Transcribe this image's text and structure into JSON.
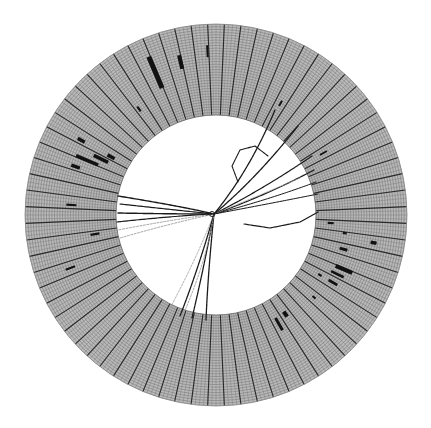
{
  "figure": {
    "type": "particle-detector-event-display",
    "title": ""
  },
  "geometry": {
    "center": [
      216,
      215
    ],
    "inner_radius": 100,
    "outer_radius": 191,
    "tower_segments": 72,
    "layer_rings": 34,
    "colors": {
      "background": "#ffffff",
      "ring_fill": "#b9b9b9",
      "fine_line": "#7a7a7a",
      "segment_line": "#2a2a2a",
      "hit": "#111111",
      "track": "#1a1a1a",
      "track_faint": "#9a9a9a"
    }
  },
  "hits": [
    {
      "angle": 200,
      "r0": 150,
      "r1": 160,
      "w": 2.2
    },
    {
      "angle": 189,
      "r0": 118,
      "r1": 127,
      "w": 2.2
    },
    {
      "angle": 176,
      "r0": 140,
      "r1": 150,
      "w": 2.2
    },
    {
      "angle": 161,
      "r0": 144,
      "r1": 153,
      "w": 3.5
    },
    {
      "angle": 157,
      "r0": 128,
      "r1": 152,
      "w": 3.5
    },
    {
      "angle": 154,
      "r0": 120,
      "r1": 136,
      "w": 3.5
    },
    {
      "angle": 151,
      "r0": 116,
      "r1": 124,
      "w": 3.5
    },
    {
      "angle": 151,
      "r0": 150,
      "r1": 158,
      "w": 3.5
    },
    {
      "angle": 126,
      "r0": 128,
      "r1": 134,
      "w": 2.2
    },
    {
      "angle": 113,
      "r0": 138,
      "r1": 172,
      "w": 5.0
    },
    {
      "angle": 103,
      "r0": 150,
      "r1": 164,
      "w": 4.0
    },
    {
      "angle": 93,
      "r0": 158,
      "r1": 170,
      "w": 2.0
    },
    {
      "angle": 330,
      "r0": 118,
      "r1": 122,
      "w": 2.2
    },
    {
      "angle": 305,
      "r0": 118,
      "r1": 124,
      "w": 4.0
    },
    {
      "angle": 300,
      "r0": 119,
      "r1": 133,
      "w": 3.0
    },
    {
      "angle": 320,
      "r0": 126,
      "r1": 130,
      "w": 2.2
    },
    {
      "angle": 330,
      "r0": 130,
      "r1": 140,
      "w": 2.6
    },
    {
      "angle": 334,
      "r0": 128,
      "r1": 142,
      "w": 2.6
    },
    {
      "angle": 337,
      "r0": 130,
      "r1": 148,
      "w": 4.0
    },
    {
      "angle": 345,
      "r0": 128,
      "r1": 136,
      "w": 3.0
    },
    {
      "angle": 352,
      "r0": 128,
      "r1": 132,
      "w": 2.2
    },
    {
      "angle": 350,
      "r0": 157,
      "r1": 163,
      "w": 3.5
    },
    {
      "angle": 356,
      "r0": 112,
      "r1": 118,
      "w": 2.2
    },
    {
      "angle": 30,
      "r0": 120,
      "r1": 128,
      "w": 2.0
    },
    {
      "angle": 60,
      "r0": 126,
      "r1": 132,
      "w": 2.0
    }
  ],
  "tracks": [
    {
      "points": [
        [
          214,
          214
        ],
        [
          180,
          206
        ],
        [
          118,
          196
        ]
      ],
      "width": 1.4,
      "faint": false
    },
    {
      "points": [
        [
          214,
          214
        ],
        [
          175,
          210
        ],
        [
          120,
          204
        ]
      ],
      "width": 1.2,
      "faint": false
    },
    {
      "points": [
        [
          214,
          214
        ],
        [
          170,
          214
        ],
        [
          118,
          213
        ]
      ],
      "width": 1.4,
      "faint": false
    },
    {
      "points": [
        [
          214,
          214
        ],
        [
          172,
          216
        ],
        [
          117,
          222
        ]
      ],
      "width": 1.2,
      "faint": false
    },
    {
      "points": [
        [
          214,
          214
        ],
        [
          170,
          220
        ],
        [
          118,
          230
        ]
      ],
      "width": 0.9,
      "faint": true
    },
    {
      "points": [
        [
          214,
          214
        ],
        [
          168,
          224
        ],
        [
          120,
          238
        ]
      ],
      "width": 0.9,
      "faint": true
    },
    {
      "points": [
        [
          214,
          214
        ],
        [
          195,
          262
        ],
        [
          170,
          308
        ]
      ],
      "width": 0.8,
      "faint": true
    },
    {
      "points": [
        [
          214,
          214
        ],
        [
          198,
          270
        ],
        [
          180,
          316
        ]
      ],
      "width": 1.3,
      "faint": false
    },
    {
      "points": [
        [
          214,
          214
        ],
        [
          203,
          272
        ],
        [
          192,
          318
        ]
      ],
      "width": 1.3,
      "faint": false
    },
    {
      "points": [
        [
          214,
          214
        ],
        [
          208,
          272
        ],
        [
          206,
          320
        ]
      ],
      "width": 1.3,
      "faint": false
    },
    {
      "points": [
        [
          214,
          214
        ],
        [
          205,
          268
        ],
        [
          178,
          326
        ]
      ],
      "width": 0.9,
      "faint": true
    },
    {
      "points": [
        [
          214,
          214
        ],
        [
          250,
          170
        ],
        [
          275,
          110
        ]
      ],
      "width": 1.3,
      "faint": false
    },
    {
      "points": [
        [
          214,
          214
        ],
        [
          255,
          180
        ],
        [
          298,
          126
        ]
      ],
      "width": 1.3,
      "faint": false
    },
    {
      "points": [
        [
          214,
          214
        ],
        [
          262,
          190
        ],
        [
          312,
          156
        ]
      ],
      "width": 1.2,
      "faint": false
    },
    {
      "points": [
        [
          214,
          214
        ],
        [
          265,
          196
        ],
        [
          314,
          170
        ]
      ],
      "width": 1.2,
      "faint": false
    },
    {
      "points": [
        [
          214,
          214
        ],
        [
          268,
          200
        ],
        [
          316,
          182
        ]
      ],
      "width": 1.0,
      "faint": false
    },
    {
      "points": [
        [
          214,
          214
        ],
        [
          268,
          204
        ],
        [
          318,
          194
        ]
      ],
      "width": 1.0,
      "faint": false
    },
    {
      "points": [
        [
          214,
          214
        ],
        [
          258,
          196
        ],
        [
          300,
          178
        ]
      ],
      "width": 0.8,
      "faint": true
    },
    {
      "points": [
        [
          244,
          224
        ],
        [
          270,
          228
        ],
        [
          300,
          222
        ],
        [
          318,
          212
        ]
      ],
      "width": 1.2,
      "faint": false
    },
    {
      "points": [
        [
          238,
          182
        ],
        [
          232,
          166
        ],
        [
          240,
          150
        ],
        [
          255,
          146
        ],
        [
          268,
          156
        ]
      ],
      "width": 1.1,
      "faint": false
    }
  ],
  "vertex": {
    "x": 212,
    "y": 214,
    "radius": 2.5
  }
}
